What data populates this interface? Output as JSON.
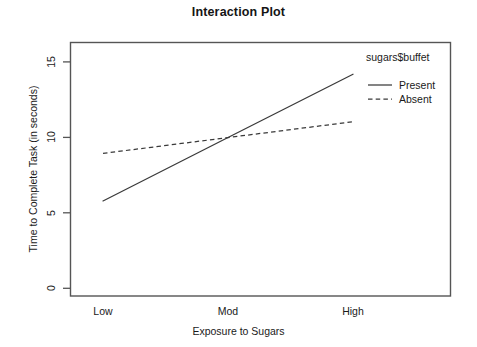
{
  "chart_data": {
    "type": "line",
    "title": "Interaction Plot",
    "xlabel": "Exposure to Sugars",
    "ylabel": "Time to Complete Task (in seconds)",
    "categories": [
      "Low",
      "Mod",
      "High"
    ],
    "series": [
      {
        "name": "Present",
        "values": [
          6,
          10,
          14
        ],
        "linestyle": "solid"
      },
      {
        "name": "Absent",
        "values": [
          9,
          10,
          11
        ],
        "linestyle": "dashed"
      }
    ],
    "ylim": [
      0,
      16
    ],
    "yticks": [
      0,
      5,
      10,
      15
    ],
    "ytick_labels": [
      "0",
      "5",
      "10",
      "15"
    ],
    "grid": false,
    "legend_title": "sugars$buffet",
    "legend_position": "top-right-outside",
    "line_color": "#333333",
    "axis_color": "#555555",
    "background": "#ffffff"
  },
  "axes": {
    "y_tick_0": "0",
    "y_tick_1": "5",
    "y_tick_2": "10",
    "y_tick_3": "15",
    "x_tick_0": "Low",
    "x_tick_1": "Mod",
    "x_tick_2": "High"
  },
  "legend": {
    "title": "sugars$buffet",
    "entry_0": "Present",
    "entry_1": "Absent"
  }
}
